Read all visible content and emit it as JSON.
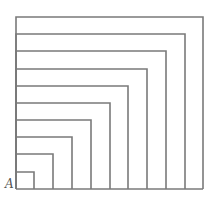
{
  "diagram": {
    "corner_label": "A",
    "square_count": 10,
    "stroke_color": "#7a7a7a",
    "background": "#ffffff",
    "origin": {
      "x": 16,
      "y": 189
    },
    "sizes": [
      {
        "w": 18,
        "h": 17
      },
      {
        "w": 37,
        "h": 35
      },
      {
        "w": 56,
        "h": 52
      },
      {
        "w": 75,
        "h": 69
      },
      {
        "w": 94,
        "h": 86
      },
      {
        "w": 112,
        "h": 103
      },
      {
        "w": 131,
        "h": 120
      },
      {
        "w": 150,
        "h": 138
      },
      {
        "w": 169,
        "h": 155
      },
      {
        "w": 187,
        "h": 172
      }
    ]
  }
}
